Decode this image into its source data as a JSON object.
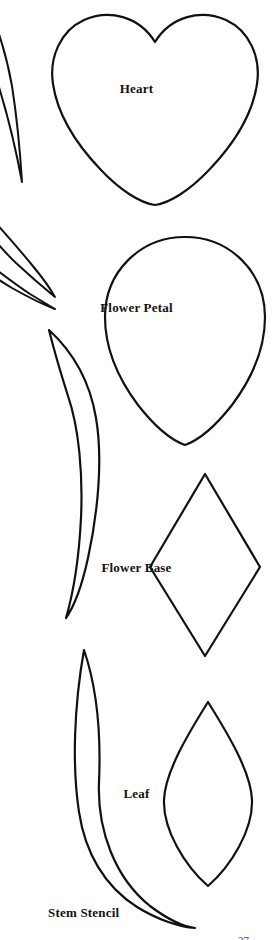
{
  "document": {
    "kind": "paper-flower-stencil-sheet",
    "background_color": "#ffffff",
    "ink_color": "#111111",
    "width": 273,
    "height": 940
  },
  "shapes": [
    {
      "id": "stem-partial-top",
      "label": "",
      "icon": "crescent-stem-shape",
      "note": "partial crescent cropped by the left page edge"
    },
    {
      "id": "heart",
      "label": "Heart",
      "icon": "heart-shape"
    },
    {
      "id": "stem-partial-mid-upper",
      "label": "",
      "icon": "crescent-stem-shape",
      "note": "partial crescent cropped by the left page edge"
    },
    {
      "id": "flower-petal",
      "label": "Flower Petal",
      "icon": "teardrop-petal-shape"
    },
    {
      "id": "stem-middle",
      "label": "",
      "icon": "crescent-stem-shape"
    },
    {
      "id": "flower-base",
      "label": "Flower Base",
      "icon": "diamond-shape"
    },
    {
      "id": "leaf",
      "label": "Leaf",
      "icon": "pointed-oval-leaf-shape"
    },
    {
      "id": "stem-stencil",
      "label": "Stem Stencil",
      "icon": "crescent-stem-shape"
    }
  ],
  "page_footer": {
    "page_number": "27"
  }
}
